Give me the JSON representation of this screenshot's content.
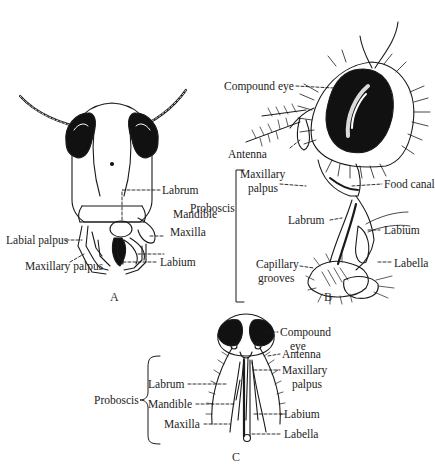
{
  "figure": {
    "panels": [
      {
        "id": "A",
        "caption": "A",
        "labels": {
          "labrum": "Labrum",
          "mandible": "Mandible",
          "maxilla": "Maxilla",
          "labial_palpus": "Labial palpus",
          "maxillary_palpus": "Maxillary palpus",
          "labium": "Labium"
        }
      },
      {
        "id": "B",
        "caption": "B",
        "labels": {
          "compound_eye": "Compound eye",
          "antenna": "Antenna",
          "maxillary_palpus_1": "Maxillary",
          "maxillary_palpus_2": "palpus",
          "proboscis": "Proboscis",
          "food_canal": "Food canal",
          "labrum": "Labrum",
          "labium": "Labium",
          "capillary_grooves_1": "Capillary",
          "capillary_grooves_2": "grooves",
          "labella": "Labella"
        }
      },
      {
        "id": "C",
        "caption": "C",
        "labels": {
          "compound_eye_1": "Compound",
          "compound_eye_2": "eye",
          "antenna": "Antenna",
          "maxillary_palpus_1": "Maxillary",
          "maxillary_palpus_2": "palpus",
          "proboscis": "Proboscis",
          "labrum": "Labrum",
          "mandible": "Mandible",
          "maxilla": "Maxilla",
          "labium": "Labium",
          "labella": "Labella"
        }
      }
    ],
    "colors": {
      "ink": "#1a1a1a",
      "background": "#ffffff"
    }
  }
}
